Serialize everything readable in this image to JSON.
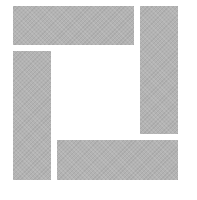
{
  "logo": {
    "shape": "four-bar-square-frame",
    "fill_color": "#b3b3b3",
    "background_color": "#ffffff",
    "bars": [
      {
        "name": "top",
        "x": 13,
        "y": 6,
        "width": 121,
        "height": 39
      },
      {
        "name": "right",
        "x": 140,
        "y": 6,
        "width": 38,
        "height": 128
      },
      {
        "name": "left",
        "x": 13,
        "y": 51,
        "width": 38,
        "height": 129
      },
      {
        "name": "bottom",
        "x": 57,
        "y": 140,
        "width": 121,
        "height": 40
      }
    ]
  }
}
